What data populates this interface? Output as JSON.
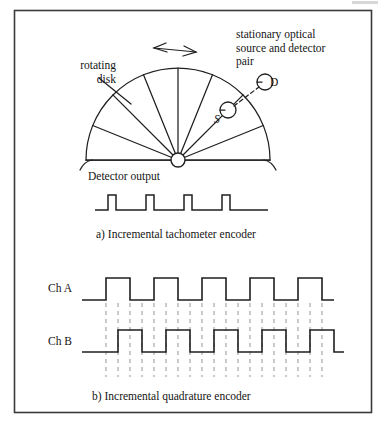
{
  "figure": {
    "border_color": "#3a3a3a",
    "stroke_color": "#1f1f1f",
    "dash_color": "#9a9a9a",
    "background": "#ffffff",
    "border": {
      "x": 14,
      "y": 10,
      "width": 358,
      "height": 403
    }
  },
  "panel_a": {
    "caption": "a) Incremental tachometer encoder",
    "labels": {
      "rotating_disk": "rotating\ndisk",
      "stationary_pair": "stationary optical\nsource and detector\npair",
      "source": "S",
      "detector": "D",
      "detector_output": "Detector output"
    },
    "disk": {
      "center_x": 178,
      "center_y": 160,
      "radius": 92,
      "hub_radius": 7,
      "spoke_angles_deg": [
        0,
        22,
        45,
        68,
        90,
        112,
        135,
        158,
        180
      ],
      "rotation_arrow": "double-headed"
    },
    "optics": {
      "source_circle": {
        "cx": 228,
        "cy": 110,
        "r": 8
      },
      "detector_circle": {
        "cx": 265,
        "cy": 82,
        "r": 8
      },
      "link": "dashed"
    },
    "waveform": {
      "type": "pulse-train",
      "baseline_y": 210,
      "high_y": 195,
      "start_x": 95,
      "end_x": 268,
      "pulse_width": 8,
      "period": 38,
      "pulse_count": 4,
      "pulse_starts": [
        108,
        146,
        184,
        222
      ]
    }
  },
  "panel_b": {
    "caption": "b) Incremental quadrature encoder",
    "channels": [
      {
        "name": "Ch A",
        "low_y": 300,
        "high_y": 278,
        "start_x": 82,
        "end_x": 322,
        "period": 48,
        "duty": 0.5,
        "phase_offset_x": 0,
        "first_rise_x": 106,
        "cycles": 5
      },
      {
        "name": "Ch B",
        "low_y": 352,
        "high_y": 330,
        "start_x": 82,
        "end_x": 332,
        "period": 48,
        "duty": 0.5,
        "phase_offset_x": 12,
        "first_rise_x": 118,
        "cycles": 5
      }
    ],
    "gridlines": {
      "style": "dashed",
      "top_y": 303,
      "bottom_y": 377,
      "spacing": 12,
      "start_x": 106,
      "count": 19
    }
  }
}
